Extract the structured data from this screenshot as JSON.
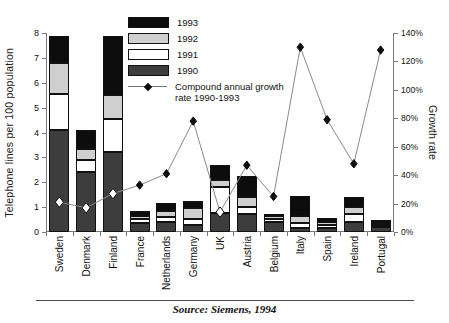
{
  "chart_data": {
    "type": "bar",
    "title": "",
    "subtitle": "",
    "categories": [
      "Sweden",
      "Denmark",
      "Finland",
      "France",
      "Netherlands",
      "Germany",
      "UK",
      "Austria",
      "Belgium",
      "Italy",
      "Spain",
      "Ireland",
      "Portugal"
    ],
    "series": [
      {
        "name": "1990",
        "values": [
          4.1,
          2.4,
          3.2,
          0.35,
          0.42,
          0.28,
          0.75,
          0.72,
          0.42,
          0.16,
          0.18,
          0.42,
          0.2
        ]
      },
      {
        "name": "1991",
        "values": [
          1.45,
          0.5,
          1.35,
          0.16,
          0.18,
          0.24,
          1.05,
          0.3,
          0.12,
          0.22,
          0.12,
          0.32,
          0.08
        ]
      },
      {
        "name": "1992",
        "values": [
          1.25,
          0.45,
          0.95,
          0.12,
          0.26,
          0.46,
          0.28,
          0.4,
          0.1,
          0.28,
          0.12,
          0.26,
          0.08
        ]
      },
      {
        "name": "1993",
        "values": [
          1.1,
          0.75,
          2.4,
          0.2,
          0.3,
          0.28,
          0.62,
          0.85,
          0.1,
          0.78,
          0.14,
          0.4,
          0.14
        ]
      }
    ],
    "totals": [
      7.9,
      4.1,
      7.0,
      0.83,
      1.16,
      1.26,
      2.7,
      2.27,
      0.74,
      1.44,
      0.56,
      1.4,
      0.5
    ],
    "growth_series": {
      "name": "Compound annual growth rate 1990-1993",
      "values": [
        21,
        17,
        27,
        33,
        41,
        78,
        14,
        47,
        25,
        130,
        79,
        48,
        128
      ],
      "marker": "diamond",
      "hollow_markers": [
        0,
        1,
        2,
        6
      ]
    },
    "ylabel": "Telephone lines per 100 population",
    "y2label": "Growth rate",
    "xlabel": "",
    "ylim": [
      0,
      8
    ],
    "y2lim": [
      0,
      140
    ],
    "yticks": [
      "0",
      "1",
      "2",
      "3",
      "4",
      "5",
      "6",
      "7",
      "8"
    ],
    "y2ticks": [
      "0%",
      "20%",
      "40%",
      "60%",
      "80%",
      "100%",
      "120%",
      "140%"
    ],
    "grid": false,
    "legend_position": "top-center"
  },
  "legend": {
    "entries": [
      {
        "label": "1993",
        "color": "#0d0d0d"
      },
      {
        "label": "1992",
        "color": "#cfcfcf"
      },
      {
        "label": "1991",
        "color": "#ffffff"
      },
      {
        "label": "1990",
        "color": "#3d3d3d"
      }
    ],
    "growth_label_line1": "Compound annual growth",
    "growth_label_line2": "rate 1990-1993"
  },
  "footer": {
    "source": "Source: Siemens, 1994"
  }
}
